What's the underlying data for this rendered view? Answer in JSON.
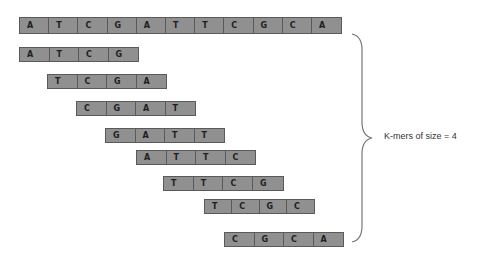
{
  "sequence": {
    "letters": [
      "A",
      "T",
      "C",
      "G",
      "A",
      "T",
      "T",
      "C",
      "G",
      "C",
      "A"
    ],
    "x": 19,
    "y": 17,
    "cell_width": 29.2,
    "height": 17
  },
  "kmers": [
    {
      "letters": [
        "A",
        "T",
        "C",
        "G"
      ],
      "x": 19,
      "y": 47,
      "cell_width": 29.5
    },
    {
      "letters": [
        "T",
        "C",
        "G",
        "A"
      ],
      "x": 47,
      "y": 74,
      "cell_width": 29.5
    },
    {
      "letters": [
        "C",
        "G",
        "A",
        "T"
      ],
      "x": 76,
      "y": 101,
      "cell_width": 29.5
    },
    {
      "letters": [
        "G",
        "A",
        "T",
        "T"
      ],
      "x": 105,
      "y": 128,
      "cell_width": 29.5
    },
    {
      "letters": [
        "A",
        "T",
        "T",
        "C"
      ],
      "x": 136,
      "y": 150,
      "cell_width": 29.5
    },
    {
      "letters": [
        "T",
        "T",
        "C",
        "G"
      ],
      "x": 163,
      "y": 176,
      "cell_width": 29.7
    },
    {
      "letters": [
        "T",
        "C",
        "G",
        "C"
      ],
      "x": 204,
      "y": 199,
      "cell_width": 27.3
    },
    {
      "letters": [
        "C",
        "G",
        "C",
        "A"
      ],
      "x": 224,
      "y": 232,
      "cell_width": 29.5
    }
  ],
  "brace": {
    "label": "K-mers of size = 4"
  },
  "colors": {
    "cell_fill": "#909090",
    "cell_border": "#5a5a5a",
    "text": "#1e1e1e"
  }
}
